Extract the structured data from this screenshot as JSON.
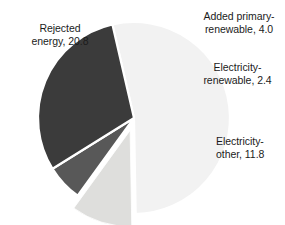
{
  "chart_data": {
    "type": "pie",
    "title": "",
    "subtitle": "",
    "xlabel": "",
    "ylabel": "",
    "legend_position": "none",
    "grid": false,
    "total": 39.0,
    "units": "quads",
    "categories": [
      "Rejected energy",
      "Added primary-renewable",
      "Electricity-renewable",
      "Electricity-other"
    ],
    "values": [
      20.8,
      4.0,
      2.4,
      11.8
    ],
    "colors": [
      "#f2f2f2",
      "#dededc",
      "#585858",
      "#3b3b3b"
    ],
    "slices": [
      {
        "name": "Rejected energy",
        "label": "Rejected\nenergy, 20.8",
        "value": 20.8,
        "percent": 53.3,
        "color": "#f2f2f2",
        "exploded": false
      },
      {
        "name": "Added primary-renewable",
        "label": "Added primary-\nrenewable, 4.0",
        "value": 4.0,
        "percent": 10.3,
        "color": "#dededc",
        "exploded": true
      },
      {
        "name": "Electricity-renewable",
        "label": "Electricity-\nrenewable, 2.4",
        "value": 2.4,
        "percent": 6.2,
        "color": "#585858",
        "exploded": false
      },
      {
        "name": "Electricity-other",
        "label": "Electricity-\nother, 11.8",
        "value": 11.8,
        "percent": 30.3,
        "color": "#3b3b3b",
        "exploded": false
      }
    ]
  },
  "labels": {
    "rejected_energy": "Rejected\nenergy, 20.8",
    "added_primary_renewable": "Added primary-\nrenewable, 4.0",
    "electricity_renewable": "Electricity-\nrenewable, 2.4",
    "electricity_other": "Electricity-\nother, 11.8"
  },
  "style": {
    "background": "#ffffff",
    "text_color": "#1b1b1b",
    "separator_color": "#ffffff"
  }
}
